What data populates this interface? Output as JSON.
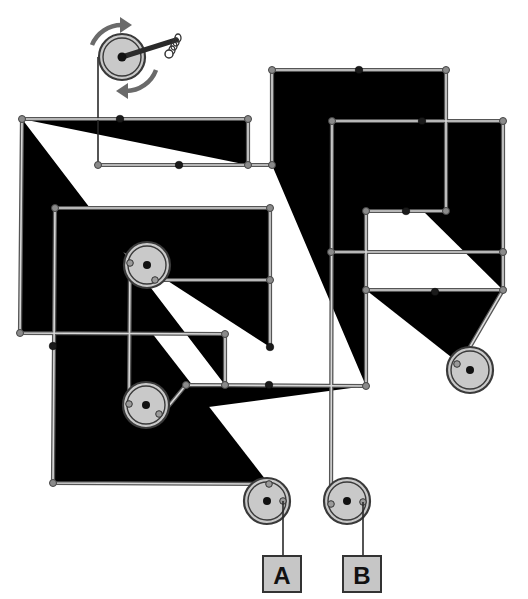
{
  "diagram": {
    "crank": {
      "center": [
        122,
        57
      ],
      "radius": 22,
      "handle_end": [
        180,
        40
      ],
      "rotation_arrows": "bidirectional"
    },
    "wheels": [
      {
        "id": "crank-wheel",
        "center": [
          122,
          57
        ],
        "radius": 22
      },
      {
        "id": "wheel-upper-left",
        "center": [
          147,
          265
        ],
        "radius": 23
      },
      {
        "id": "wheel-lower-left",
        "center": [
          146,
          405
        ],
        "radius": 23
      },
      {
        "id": "wheel-right",
        "center": [
          470,
          370
        ],
        "radius": 23
      },
      {
        "id": "wheel-a",
        "center": [
          267,
          501
        ],
        "radius": 23
      },
      {
        "id": "wheel-b",
        "center": [
          347,
          501
        ],
        "radius": 23
      }
    ],
    "outputs": [
      {
        "label": "A",
        "box": [
          263,
          556,
          38,
          36
        ]
      },
      {
        "label": "B",
        "box": [
          343,
          556,
          38,
          36
        ]
      }
    ],
    "colors": {
      "rod": "#555555",
      "wheel_fill": "#c9c9c9",
      "pivot": "#1a1a1a",
      "arrow": "#6a6a6a",
      "label_box": "#c6c6c6"
    }
  }
}
